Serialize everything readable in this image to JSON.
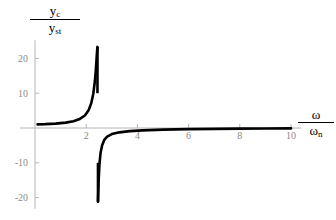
{
  "figure": {
    "background_color": "#ffffff",
    "curve_color": "#000000",
    "axis_color": "#b4b4b4",
    "tick_label_color": "#8a8a8a"
  },
  "axis_labels": {
    "y_numerator": "y",
    "y_numerator_sub": "c",
    "y_denominator": "y",
    "y_denominator_sub": "st",
    "x_numerator": "ω",
    "x_denominator": "ω",
    "x_denominator_sub": "n"
  },
  "chart_data": {
    "type": "line",
    "title": "",
    "xlabel": "ω/ωₙ",
    "ylabel": "y_c/y_st",
    "xlim": [
      0,
      10.4
    ],
    "ylim": [
      -21.5,
      23.5
    ],
    "grid": false,
    "legend": null,
    "xticks": [
      2,
      4,
      6,
      8,
      10
    ],
    "xtick_labels": [
      "2",
      "4",
      "6",
      "8",
      "10"
    ],
    "yticks": [
      20,
      10,
      -10,
      -20
    ],
    "ytick_labels": [
      "20",
      "10",
      "-10",
      "-20"
    ],
    "annotations": [
      {
        "text": "vertical asymptote",
        "x": 2.45,
        "y": 0
      }
    ],
    "series": [
      {
        "name": "y_c/y_st",
        "asymptote_x": 2.45,
        "description": "Resonance / vibration-absorber amplitude ratio. Positive branch rises from ~1.0 at x=0 to +23 just left of the asymptote at x=2.45; negative branch drops to -21 just right of the asymptote then rises asymptotically toward 0 from below as x increases to 10.",
        "x": [
          0.1,
          0.4,
          0.8,
          1.2,
          1.5,
          1.75,
          1.95,
          2.1,
          2.2,
          2.28,
          2.34,
          2.38,
          2.41,
          2.43,
          2.44,
          2.46,
          2.47,
          2.49,
          2.52,
          2.56,
          2.62,
          2.7,
          2.82,
          3.0,
          3.3,
          3.7,
          4.2,
          5.0,
          6.0,
          7.0,
          8.0,
          9.0,
          10.0
        ],
        "y": [
          1.05,
          1.1,
          1.25,
          1.55,
          1.95,
          2.6,
          3.6,
          5.2,
          7.2,
          10.0,
          13.5,
          17.0,
          20.5,
          22.6,
          23.3,
          -21.2,
          -19.0,
          -14.5,
          -10.2,
          -7.2,
          -5.0,
          -3.5,
          -2.45,
          -1.75,
          -1.25,
          -0.9,
          -0.68,
          -0.46,
          -0.32,
          -0.24,
          -0.19,
          -0.15,
          -0.12
        ]
      }
    ]
  }
}
